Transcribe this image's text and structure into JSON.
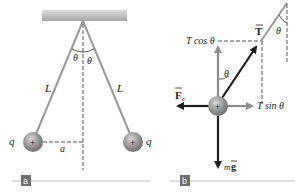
{
  "figure": {
    "panel_a": {
      "tag": "a",
      "charge_left": "q",
      "charge_right": "q",
      "string_left": "L",
      "string_right": "L",
      "angle_left": "θ",
      "angle_right": "θ",
      "distance": "a",
      "ball_sign": "+"
    },
    "panel_b": {
      "tag": "b",
      "tension": "T",
      "tension_vertical": "T cos θ",
      "tension_horizontal": "T sin θ",
      "electric_force": "F",
      "electric_force_sub": "e",
      "weight_m": "m",
      "weight_g": "g",
      "angle_top": "θ",
      "angle_ball": "θ",
      "ball_sign": "+"
    }
  },
  "colors": {
    "string": "#999999",
    "ball": "#8a8a8a",
    "vector_dark": "#1e1e1e",
    "vector_gray": "#8c8c8c",
    "tag_bg": "#6e6e6e",
    "baseline": "#d2d2d2"
  }
}
